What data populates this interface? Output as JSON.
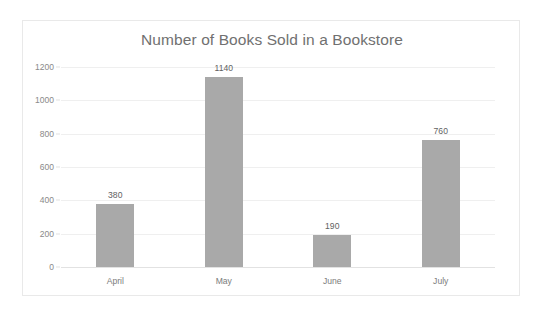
{
  "chart_data": {
    "type": "bar",
    "title": "Number of Books Sold in a Bookstore",
    "xlabel": "",
    "ylabel": "",
    "categories": [
      "April",
      "May",
      "June",
      "July"
    ],
    "values": [
      380,
      1140,
      190,
      760
    ],
    "value_labels": [
      "380",
      "1140",
      "190",
      "760"
    ],
    "ylim": [
      0,
      1200
    ],
    "ytick_values": [
      0,
      200,
      400,
      600,
      800,
      1000,
      1200
    ],
    "ytick_labels": [
      "0",
      "200",
      "400",
      "600",
      "800",
      "1000",
      "1200"
    ],
    "grid": true,
    "legend": false,
    "series": [
      {
        "name": "Books Sold",
        "values": [
          380,
          1140,
          190,
          760
        ]
      }
    ],
    "colors": {
      "bar": "#a8a8a8",
      "title_text": "#6e6e6e",
      "tick_text": "#888888",
      "value_text": "#5e5e5e",
      "category_text": "#7a7a7a",
      "gridline": "#efefef",
      "axis_line": "#e2e2e2",
      "frame_border": "#e9e9e9",
      "background": "#ffffff"
    }
  }
}
